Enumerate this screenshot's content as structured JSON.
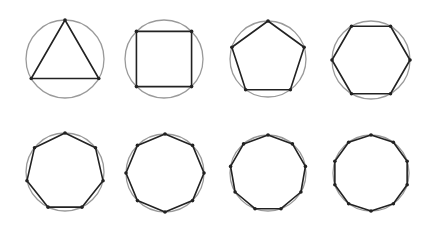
{
  "figure": {
    "colors": {
      "circle": "#9a9a9a",
      "polygon": "#222222",
      "background": "#ffffff"
    },
    "shapes": [
      {
        "name": "triangle",
        "sides": 3,
        "cx": 65,
        "cy": 59,
        "r": 39,
        "rotation_deg": -90
      },
      {
        "name": "square",
        "sides": 4,
        "cx": 164,
        "cy": 59,
        "r": 39,
        "rotation_deg": -135
      },
      {
        "name": "pentagon",
        "sides": 5,
        "cx": 268,
        "cy": 59,
        "r": 38,
        "rotation_deg": -90
      },
      {
        "name": "hexagon",
        "sides": 6,
        "cx": 371,
        "cy": 60,
        "r": 39,
        "rotation_deg": 0
      },
      {
        "name": "heptagon",
        "sides": 7,
        "cx": 65,
        "cy": 172,
        "r": 39,
        "rotation_deg": -90
      },
      {
        "name": "octagon",
        "sides": 8,
        "cx": 165,
        "cy": 173,
        "r": 39,
        "rotation_deg": -90
      },
      {
        "name": "nonagon",
        "sides": 9,
        "cx": 268,
        "cy": 173,
        "r": 38,
        "rotation_deg": -90
      },
      {
        "name": "decagon",
        "sides": 10,
        "cx": 371,
        "cy": 173,
        "r": 38,
        "rotation_deg": -90
      }
    ]
  }
}
